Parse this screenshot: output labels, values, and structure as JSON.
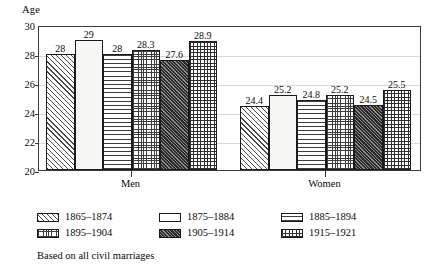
{
  "chart_data": {
    "type": "bar",
    "title": "",
    "xlabel": "",
    "ylabel": "Age",
    "ylim": [
      20,
      30
    ],
    "yticks": [
      20,
      22,
      24,
      26,
      28,
      30
    ],
    "grid": true,
    "legend_position": "below",
    "categories": [
      "Men",
      "Women"
    ],
    "series": [
      {
        "name": "1865–1874",
        "pattern": "diagonal-hatch",
        "values": [
          28,
          24.4
        ],
        "labels": [
          "28",
          "24.4"
        ]
      },
      {
        "name": "1875–1884",
        "pattern": "empty",
        "values": [
          29,
          25.2
        ],
        "labels": [
          "29",
          "25.2"
        ]
      },
      {
        "name": "1885–1894",
        "pattern": "horizontal-lines",
        "values": [
          28,
          24.8
        ],
        "labels": [
          "28",
          "24.8"
        ]
      },
      {
        "name": "1895–1904",
        "pattern": "fine-dots",
        "values": [
          28.3,
          25.2
        ],
        "labels": [
          "28.3",
          "25.2"
        ]
      },
      {
        "name": "1905–1914",
        "pattern": "dense-dark-hatch",
        "values": [
          27.6,
          24.5
        ],
        "labels": [
          "27.6",
          "24.5"
        ]
      },
      {
        "name": "1915–1921",
        "pattern": "crosshatch-grid",
        "values": [
          28.9,
          25.5
        ],
        "labels": [
          "28.9",
          "25.5"
        ]
      }
    ],
    "footnote": "Based on all civil marriages"
  },
  "colors": {
    "axis": "#3a3a3a",
    "grid": "#d8d8d8",
    "bar_outline": "#1a1a1a",
    "text": "#0a0a0a",
    "background": "#ffffff"
  }
}
